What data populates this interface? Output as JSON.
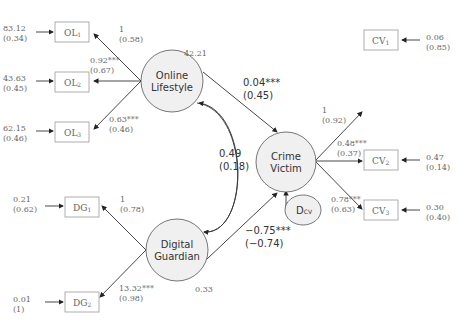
{
  "latents": {
    "online_lifestyle": {
      "line1": "Online",
      "line2": "Lifestyle",
      "variance": "42.21"
    },
    "digital_guardian": {
      "line1": "Digital",
      "line2": "Guardian",
      "variance": "0.33"
    },
    "crime_victim": {
      "line1": "Crime",
      "line2": "Victim"
    },
    "disturbance": {
      "label": "D",
      "sub": "CV"
    }
  },
  "observed": {
    "OL1": {
      "label": "OL",
      "sub": "1",
      "err": "83.12",
      "err_std": "(0.34)",
      "load": "1",
      "load_std": "(0.58)"
    },
    "OL2": {
      "label": "OL",
      "sub": "2",
      "err": "43.63",
      "err_std": "(0.45)",
      "load": "0.92***",
      "load_std": "(0.67)"
    },
    "OL3": {
      "label": "OL",
      "sub": "3",
      "err": "62.15",
      "err_std": "(0.46)",
      "load": "0.63***",
      "load_std": "(0.46)"
    },
    "DG1": {
      "label": "DG",
      "sub": "1",
      "err": "0.21",
      "err_std": "(0.62)",
      "load": "1",
      "load_std": "(0.78)"
    },
    "DG2": {
      "label": "DG",
      "sub": "2",
      "err": "0.01",
      "err_std": "(1)",
      "load": "13.32***",
      "load_std": "(0.98)"
    },
    "CV1": {
      "label": "CV",
      "sub": "1",
      "err": "0.06",
      "err_std": "(0.85)",
      "load": "1",
      "load_std": "(0.92)"
    },
    "CV2": {
      "label": "CV",
      "sub": "2",
      "err": "0.47",
      "err_std": "(0.14)",
      "load": "0.48***",
      "load_std": "(0.37)"
    },
    "CV3": {
      "label": "CV",
      "sub": "3",
      "err": "0.30",
      "err_std": "(0.40)",
      "load": "0.78***",
      "load_std": "(0.63)"
    }
  },
  "paths": {
    "ol_to_cv": {
      "coef": "0.04***",
      "std": "(0.45)"
    },
    "dg_to_cv": {
      "coef": "−0.75***",
      "std": "(−0.74)"
    },
    "ol_dg_cov": {
      "coef": "0.49",
      "std": "(0.18)"
    }
  }
}
